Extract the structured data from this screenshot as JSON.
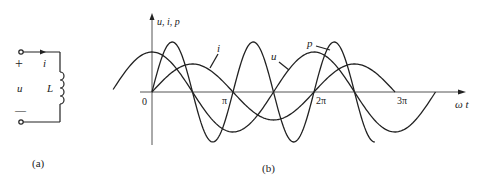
{
  "figure_a": {
    "caption": "(a)",
    "plus": "+",
    "minus": "—",
    "voltage_label": "u",
    "current_label": "i",
    "inductor_label": "L"
  },
  "figure_b": {
    "caption": "(b)",
    "y_axis_label": "u, i, p",
    "x_axis_label": "ω t",
    "origin_label": "0",
    "ticks": [
      "π",
      "2π",
      "3π"
    ],
    "curve_labels": {
      "i": "i",
      "u": "u",
      "p": "p"
    }
  },
  "chart_data": {
    "type": "line",
    "xlabel": "ωt",
    "ylabel": "u, i, p",
    "x_ticks": [
      "0",
      "π",
      "2π",
      "3π"
    ],
    "series": [
      {
        "name": "u",
        "function": "Um·cos(ωt)",
        "relative_amplitude": 0.8,
        "x_range": [
          "-π/2",
          "3.5π"
        ]
      },
      {
        "name": "i",
        "function": "Im·sin(ωt)",
        "relative_amplitude": 0.56,
        "x_range": [
          "0",
          "3π"
        ]
      },
      {
        "name": "p",
        "function": "UI·sin(2ωt)",
        "relative_amplitude": 1.0,
        "x_range": [
          "0",
          "2.75π"
        ]
      }
    ],
    "grid": false,
    "legend": "inline labels"
  }
}
